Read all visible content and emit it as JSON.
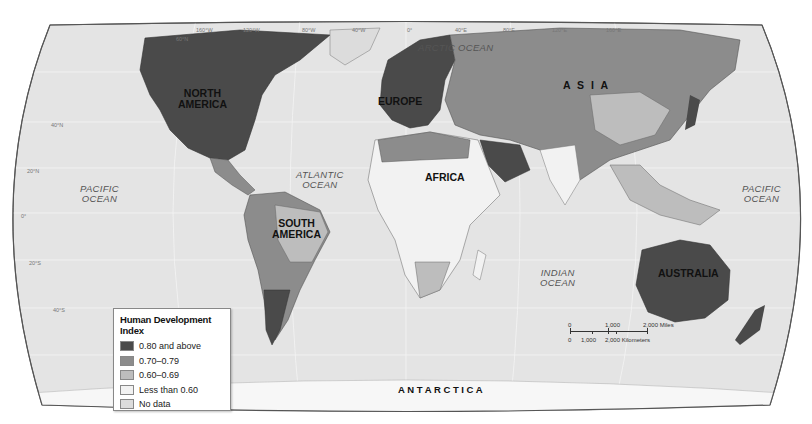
{
  "map": {
    "title": "Human Development Index",
    "continents": [
      {
        "id": "north-america",
        "label": "NORTH\nAMERICA",
        "line1": "NORTH",
        "line2": "AMERICA"
      },
      {
        "id": "south-america",
        "label": "SOUTH AMERICA",
        "line1": "SOUTH",
        "line2": "AMERICA"
      },
      {
        "id": "europe",
        "label": "EUROPE"
      },
      {
        "id": "asia",
        "label": "A S I A"
      },
      {
        "id": "africa",
        "label": "AFRICA"
      },
      {
        "id": "australia",
        "label": "AUSTRALIA"
      },
      {
        "id": "antarctica",
        "label": "A N T A R C T I C A"
      }
    ],
    "oceans": [
      {
        "id": "arctic",
        "label": "ARCTIC OCEAN"
      },
      {
        "id": "atlantic",
        "line1": "ATLANTIC",
        "line2": "OCEAN"
      },
      {
        "id": "pacific-west",
        "line1": "PACIFIC",
        "line2": "OCEAN"
      },
      {
        "id": "pacific-east",
        "line1": "PACIFIC",
        "line2": "OCEAN"
      },
      {
        "id": "indian",
        "line1": "INDIAN",
        "line2": "OCEAN"
      }
    ],
    "graticule_top": [
      "160°W",
      "120°W",
      "80°W",
      "40°W",
      "0°",
      "40°E",
      "80°E",
      "120°E",
      "160°E"
    ],
    "graticule_left": [
      "60°N",
      "40°N",
      "20°N",
      "0°",
      "20°S",
      "40°S"
    ]
  },
  "legend": {
    "title": "Human Development Index",
    "items": [
      {
        "label": "0.80 and above",
        "color": "#4a4a4a"
      },
      {
        "label": "0.70–0.79",
        "color": "#8c8c8c"
      },
      {
        "label": "0.60–0.69",
        "color": "#bdbdbd"
      },
      {
        "label": "Less than 0.60",
        "color": "#f2f2f2"
      },
      {
        "label": "No data",
        "color": "#dcdcdc"
      }
    ]
  },
  "scale_bar": {
    "miles": [
      "0",
      "1,000",
      "2,000 Miles"
    ],
    "kilometers": [
      "0",
      "1,000",
      "2,000 Kilometers"
    ]
  },
  "colors": {
    "ocean": "#e4e4e4",
    "border": "#6a6a6a"
  }
}
